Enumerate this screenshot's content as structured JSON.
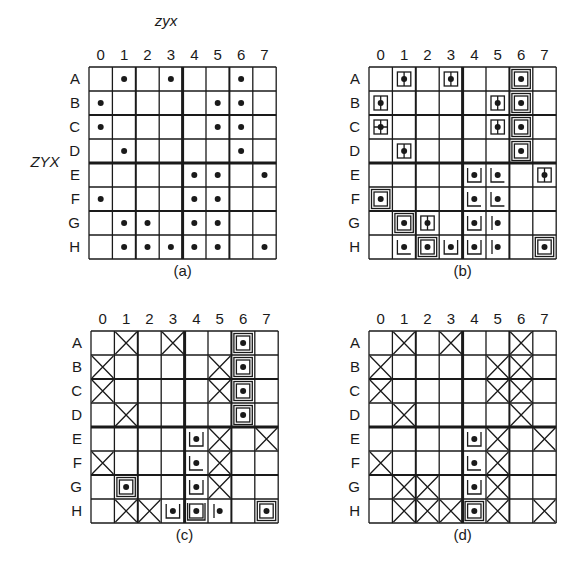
{
  "figure": {
    "col_axis_title": "zyx",
    "row_axis_title": "ZYX",
    "columns": [
      "0",
      "1",
      "2",
      "3",
      "4",
      "5",
      "6",
      "7"
    ],
    "rows": [
      "A",
      "B",
      "C",
      "D",
      "E",
      "F",
      "G",
      "H"
    ],
    "panels": [
      {
        "caption": "(a)",
        "show_col_title": true,
        "show_row_title": true,
        "cells": {
          "A": {
            "1": "dot",
            "3": "dot",
            "6": "dot"
          },
          "B": {
            "0": "dot",
            "5": "dot",
            "6": "dot"
          },
          "C": {
            "0": "dot",
            "5": "dot",
            "6": "dot"
          },
          "D": {
            "1": "dot",
            "6": "dot"
          },
          "E": {
            "4": "dot",
            "5": "dot",
            "7": "dot"
          },
          "F": {
            "0": "dot",
            "4": "dot",
            "5": "dot"
          },
          "G": {
            "1": "dot",
            "2": "dot",
            "4": "dot",
            "5": "dot"
          },
          "H": {
            "1": "dot",
            "2": "dot",
            "3": "dot",
            "4": "dot",
            "5": "dot",
            "7": "dot"
          }
        }
      },
      {
        "caption": "(b)",
        "show_col_title": false,
        "show_row_title": false,
        "cells": {
          "A": {
            "1": "box-vline",
            "3": "box-vline",
            "6": "box"
          },
          "B": {
            "0": "box-vline",
            "5": "box-vline",
            "6": "box"
          },
          "C": {
            "0": "box-cross",
            "5": "box-vline",
            "6": "box"
          },
          "D": {
            "1": "box-vline",
            "6": "box"
          },
          "E": {
            "4": "u-bracket",
            "5": "l-bracket",
            "7": "box-vline"
          },
          "F": {
            "0": "box",
            "4": "l-bracket",
            "5": "l-bracket"
          },
          "G": {
            "1": "box",
            "2": "box-vline",
            "4": "u-bracket",
            "5": "left-bar"
          },
          "H": {
            "1": "l-bracket",
            "2": "box",
            "3": "u-bracket",
            "4": "u-bracket",
            "5": "left-bar",
            "7": "box"
          }
        }
      },
      {
        "caption": "(c)",
        "show_col_title": false,
        "show_row_title": false,
        "cells": {
          "A": {
            "1": "x",
            "3": "x",
            "6": "box"
          },
          "B": {
            "0": "x",
            "5": "x",
            "6": "box"
          },
          "C": {
            "0": "x",
            "5": "x",
            "6": "box"
          },
          "D": {
            "1": "x",
            "6": "box"
          },
          "E": {
            "4": "u-bracket",
            "5": "x",
            "7": "x"
          },
          "F": {
            "0": "x",
            "4": "l-bracket",
            "5": "x"
          },
          "G": {
            "1": "box",
            "4": "u-bracket",
            "5": "x"
          },
          "H": {
            "1": "x",
            "2": "x",
            "3": "u-bracket",
            "4": "u-box",
            "5": "left-bar",
            "7": "box"
          }
        }
      },
      {
        "caption": "(d)",
        "show_col_title": false,
        "show_row_title": false,
        "cells": {
          "A": {
            "1": "x",
            "3": "x",
            "6": "x"
          },
          "B": {
            "0": "x",
            "5": "x",
            "6": "x"
          },
          "C": {
            "0": "x",
            "5": "x",
            "6": "x"
          },
          "D": {
            "1": "x",
            "6": "x"
          },
          "E": {
            "4": "u-bracket",
            "5": "x",
            "7": "x"
          },
          "F": {
            "0": "x",
            "4": "l-bracket",
            "5": "x"
          },
          "G": {
            "1": "x",
            "2": "x",
            "4": "u-bracket",
            "5": "x"
          },
          "H": {
            "1": "x",
            "2": "x",
            "3": "x",
            "4": "box",
            "5": "x",
            "7": "x"
          }
        }
      }
    ]
  }
}
